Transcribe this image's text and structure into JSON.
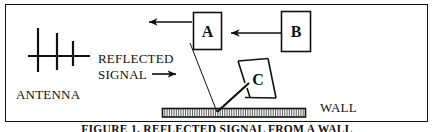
{
  "figure": {
    "width": 435,
    "height": 132,
    "background_color": "#ffffff",
    "ink_color": "#111111",
    "border": {
      "present": true,
      "style": "thin-rectangle"
    },
    "caption": "FIGURE 1. REFLECTED SIGNAL FROM A WALL"
  },
  "labels": {
    "antenna": "ANTENNA",
    "reflected_line1": "REFLECTED",
    "reflected_line2": "SIGNAL",
    "wall": "WALL"
  },
  "boxes": [
    {
      "id": "box-a",
      "letter": "A",
      "x": 193,
      "y": 12,
      "w": 29,
      "h": 38
    },
    {
      "id": "box-b",
      "letter": "B",
      "x": 281,
      "y": 11,
      "w": 30,
      "h": 41
    }
  ],
  "objects": [
    {
      "id": "object-c",
      "letter": "C",
      "shape": "parallelogram",
      "points": "238,60 268,58 276,98 244,98"
    }
  ],
  "arrows": [
    {
      "id": "arrow-a-outgoing",
      "direction": "left",
      "from_x": 192,
      "to_x": 146,
      "y": 22
    },
    {
      "id": "arrow-b-to-a",
      "direction": "left",
      "from_x": 281,
      "to_x": 228,
      "y": 33
    },
    {
      "id": "arrow-reflected-signal",
      "direction": "right",
      "from_x": 152,
      "to_x": 178,
      "y": 74
    }
  ],
  "antenna": {
    "boom": {
      "x1": 28,
      "y1": 56,
      "x2": 90,
      "y2": 56
    },
    "elements": [
      {
        "x": 38,
        "y1": 28,
        "y2": 72
      },
      {
        "x": 57,
        "y1": 33,
        "y2": 70
      },
      {
        "x": 73,
        "y1": 41,
        "y2": 66
      }
    ]
  },
  "wall": {
    "x": 162,
    "y": 108,
    "w": 144,
    "h": 9,
    "hatch_count": 62,
    "hatch_style": "vertical"
  },
  "ray_path": {
    "incident": {
      "x1": 190,
      "y1": 43,
      "x2": 217,
      "y2": 112
    },
    "reflected": {
      "x1": 217,
      "y1": 112,
      "x2": 248,
      "y2": 84
    }
  }
}
